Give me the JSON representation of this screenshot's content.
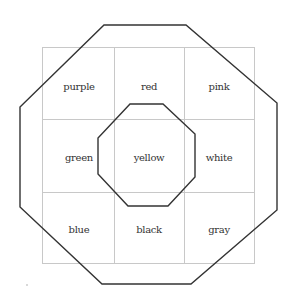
{
  "diagram": {
    "type": "3x3 color grid with two octagons",
    "grid": {
      "rows": 3,
      "cols": 3,
      "line_color": "#c8c8c8",
      "cells": [
        [
          "purple",
          "red",
          "pink"
        ],
        [
          "green",
          "yellow",
          "white"
        ],
        [
          "blue",
          "black",
          "gray"
        ]
      ]
    },
    "outer_octagon": {
      "stroke": "#333333",
      "label": "outer-octagon"
    },
    "inner_octagon": {
      "stroke": "#333333",
      "label": "inner-octagon"
    }
  },
  "labels": {
    "r0c0": "purple",
    "r0c1": "red",
    "r0c2": "pink",
    "r1c0": "green",
    "r1c1": "yellow",
    "r1c2": "white",
    "r2c0": "blue",
    "r2c1": "black",
    "r2c2": "gray"
  }
}
